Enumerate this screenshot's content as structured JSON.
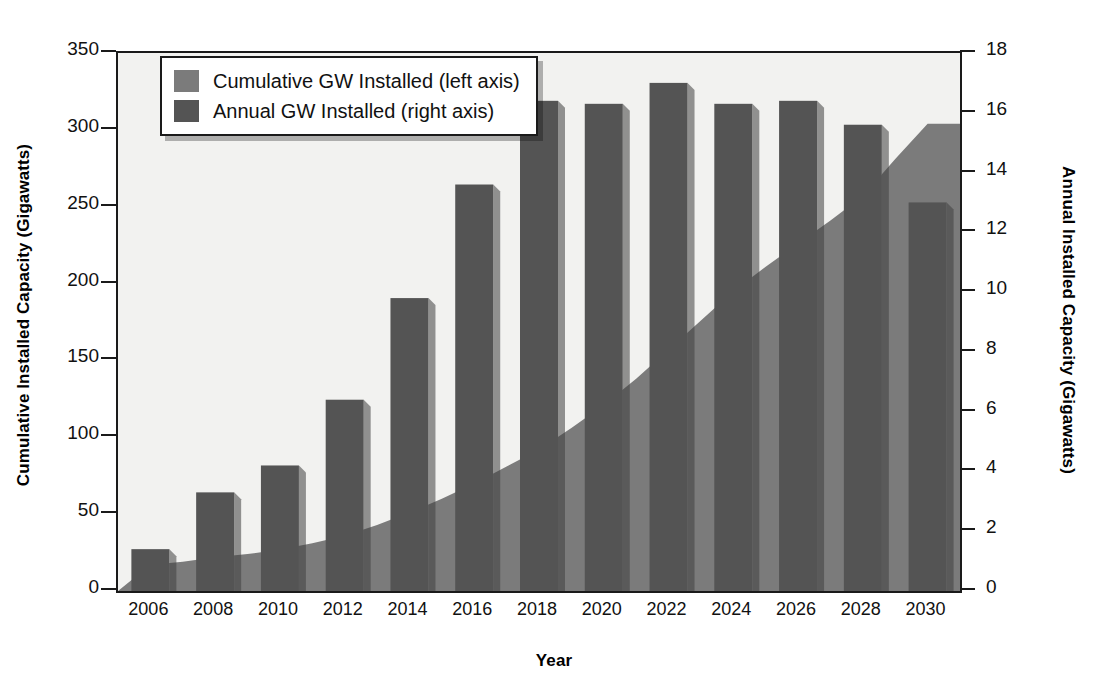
{
  "chart_data": {
    "type": "bar",
    "title": "",
    "xlabel": "Year",
    "ylabel": "Cumulative Installed Capacity (Gigawatts)",
    "ylabel_right": "Annual Installed Capacity (Gigawatts)",
    "grid": false,
    "legend_position": "top-left",
    "categories": [
      "2006",
      "2008",
      "2010",
      "2012",
      "2014",
      "2016",
      "2018",
      "2020",
      "2022",
      "2024",
      "2026",
      "2028",
      "2030"
    ],
    "x": [
      2006,
      2008,
      2010,
      2012,
      2014,
      2016,
      2018,
      2020,
      2022,
      2024,
      2026,
      2028,
      2030
    ],
    "ylim": [
      0,
      350
    ],
    "ylim_right": [
      0,
      18
    ],
    "yticks": [
      0,
      50,
      100,
      150,
      200,
      250,
      300,
      350
    ],
    "yticks_right": [
      0,
      2,
      4,
      6,
      8,
      10,
      12,
      14,
      16,
      18
    ],
    "xticks": [
      2006,
      2008,
      2010,
      2012,
      2014,
      2016,
      2018,
      2020,
      2022,
      2024,
      2026,
      2028,
      2030
    ],
    "series": [
      {
        "name": "Cumulative GW Installed (left axis)",
        "type": "area",
        "axis": "left",
        "color": "#7b7b7b",
        "x": [
          2006,
          2007,
          2008,
          2009,
          2010,
          2011,
          2012,
          2013,
          2014,
          2015,
          2016,
          2017,
          2018,
          2019,
          2020,
          2021,
          2022,
          2023,
          2024,
          2025,
          2026,
          2027,
          2028,
          2029,
          2030
        ],
        "values": [
          17,
          19,
          22,
          24,
          27,
          31,
          36,
          43,
          51,
          60,
          70,
          81,
          92,
          106,
          121,
          138,
          157,
          176,
          195,
          211,
          226,
          241,
          257,
          281,
          304
        ]
      },
      {
        "name": "Annual GW Installed (right axis)",
        "type": "bar",
        "axis": "right",
        "color": "#545454",
        "categories": [
          "2006",
          "2008",
          "2010",
          "2012",
          "2014",
          "2016",
          "2018",
          "2020",
          "2022",
          "2024",
          "2026",
          "2028",
          "2030"
        ],
        "values": [
          1.4,
          3.3,
          4.2,
          6.4,
          9.8,
          13.6,
          16.4,
          16.3,
          17.0,
          16.3,
          16.4,
          15.6,
          13.0
        ]
      }
    ]
  },
  "axes": {
    "left": {
      "title": "Cumulative Installed Capacity (Gigawatts)",
      "ticks": [
        "350",
        "300",
        "250",
        "200",
        "150",
        "100",
        "50",
        "0"
      ]
    },
    "right": {
      "title": "Annual Installed Capacity (Gigawatts)",
      "ticks": [
        "18",
        "16",
        "14",
        "12",
        "10",
        "8",
        "6",
        "4",
        "2",
        "0"
      ]
    },
    "bottom": {
      "title": "Year",
      "ticks": [
        "2006",
        "2008",
        "2010",
        "2012",
        "2014",
        "2016",
        "2018",
        "2020",
        "2022",
        "2024",
        "2026",
        "2028",
        "2030"
      ]
    }
  },
  "legend": {
    "items": [
      {
        "label": "Cumulative GW Installed (left axis)",
        "color": "#7b7b7b"
      },
      {
        "label": "Annual GW Installed (right axis)",
        "color": "#545454"
      }
    ]
  },
  "colors": {
    "cumulative": "#7b7b7b",
    "annual": "#545454",
    "axis": "#1a1a1a",
    "plot_background": "#f2f2f0"
  }
}
